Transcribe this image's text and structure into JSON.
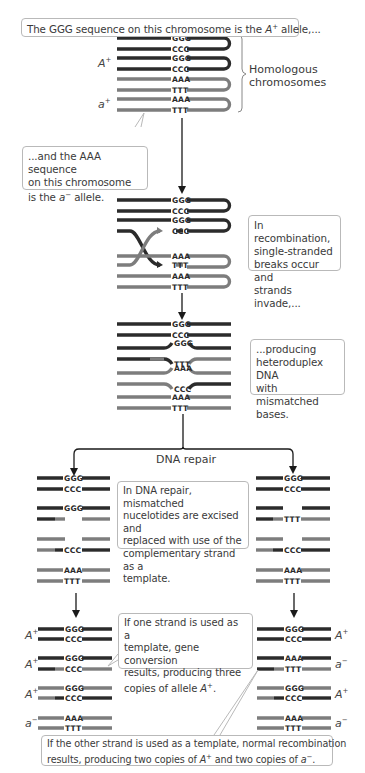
{
  "colors": {
    "strand_dark": "#2b2b2b",
    "strand_light": "#7d7d7d",
    "box_border": "#b9b9b9",
    "text": "#3a3a3a"
  },
  "callouts": {
    "top": {
      "pre": "The GGG sequence on this chromosome is the ",
      "allele": "A",
      "sup": "+",
      "post": " allele,..."
    },
    "aaa": {
      "line1": "...and the AAA sequence",
      "line2": "on this chromosome",
      "line3_pre": "is the ",
      "allele": "a",
      "sup": "−",
      "line3_post": " allele."
    },
    "recombination": {
      "line1": "In recombination,",
      "line2": "single-stranded",
      "line3": "breaks occur and",
      "line4": "strands invade,..."
    },
    "heteroduplex": {
      "line1": "...producing",
      "line2": "heteroduplex DNA",
      "line3": "with mismatched",
      "line4": "bases."
    },
    "repair": {
      "line1": "In DNA repair, mismatched",
      "line2": "nucelotides are excised and",
      "line3": "replaced with use of the",
      "line4": "complementary strand as a",
      "line5": "template."
    },
    "gene_conversion": {
      "line1": "If one strand is used as a",
      "line2": "template, gene conversion",
      "line3": "results, producing three",
      "line4_pre": "copies of allele ",
      "allele": "A",
      "sup": "+",
      "line4_post": "."
    },
    "normal": {
      "line1": "If the other strand is used as a template, normal recombination",
      "line2_pre": "results, producing two copies of ",
      "allele1": "A",
      "sup1": "+",
      "line2_mid": " and two copies of ",
      "allele2": "a",
      "sup2": "−",
      "line2_post": "."
    }
  },
  "labels": {
    "homologous": "Homologous",
    "chromosomes": "chromosomes",
    "dna_repair": "DNA repair"
  },
  "alleles": {
    "top_A": {
      "letter": "A",
      "sup": "+"
    },
    "top_a": {
      "letter": "a",
      "sup": "+"
    },
    "left": [
      {
        "letter": "A",
        "sup": "+"
      },
      {
        "letter": "A",
        "sup": "+"
      },
      {
        "letter": "A",
        "sup": "+"
      },
      {
        "letter": "a",
        "sup": "−"
      }
    ],
    "right": [
      {
        "letter": "A",
        "sup": "+"
      },
      {
        "letter": "a",
        "sup": "−"
      },
      {
        "letter": "A",
        "sup": "+"
      },
      {
        "letter": "a",
        "sup": "−"
      }
    ]
  },
  "sequences": {
    "stage1": [
      "GGG",
      "CCC",
      "GGG",
      "CCC",
      "AAA",
      "TTT",
      "AAA",
      "TTT"
    ],
    "stage2": [
      "GGG",
      "CCC",
      "GGG",
      "CCC",
      "AAA",
      "TTT",
      "AAA",
      "TTT"
    ],
    "stage3": [
      "GGG",
      "CCC",
      "GGG",
      "TTT",
      "AAA",
      "CCC",
      "AAA",
      "TTT"
    ],
    "repair_left": [
      "GGG",
      "CCC",
      "GGG",
      "",
      "",
      "CCC",
      "AAA",
      "TTT"
    ],
    "repair_right": [
      "GGG",
      "CCC",
      "",
      "TTT",
      "",
      "CCC",
      "AAA",
      "TTT"
    ],
    "final_left": [
      "GGG",
      "CCC",
      "GGG",
      "CCC",
      "GGG",
      "CCC",
      "AAA",
      "TTT"
    ],
    "final_right": [
      "GGG",
      "CCC",
      "AAA",
      "TTT",
      "GGG",
      "CCC",
      "AAA",
      "TTT"
    ]
  }
}
